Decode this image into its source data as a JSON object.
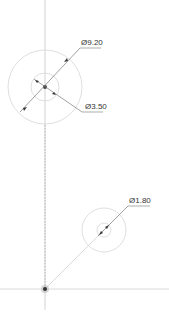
{
  "drawing": {
    "dimensions": [
      {
        "id": "outer-large",
        "label": "Ø9.20"
      },
      {
        "id": "inner-large",
        "label": "Ø3.50"
      },
      {
        "id": "small",
        "label": "Ø1.80"
      }
    ],
    "colors": {
      "construction_line": "#c8c8c8",
      "circle": "#d0d0d0",
      "dim_line": "#555555",
      "text": "#333333"
    }
  }
}
